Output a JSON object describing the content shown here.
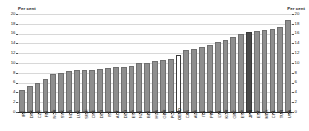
{
  "axes": {
    "left_title": "Per cent",
    "right_title": "Per cent",
    "ticks": [
      "0",
      "2",
      "4",
      "6",
      "8",
      "10",
      "12",
      "14",
      "16",
      "18",
      "20"
    ]
  },
  "chart_data": {
    "type": "bar",
    "title": "Per cent",
    "xlabel": "",
    "ylabel": "Per cent",
    "ylim": [
      0,
      20
    ],
    "grid": true,
    "legend": "none",
    "sorted": "ascending",
    "categories": [
      "IRL",
      "DNK",
      "CZE",
      "FIN",
      "NOR",
      "SVK",
      "NLD",
      "LUX",
      "SWE",
      "CHE",
      "DEU",
      "ISL",
      "AUT",
      "DEU",
      "ESP",
      "NZL",
      "BEL",
      "HUN",
      "GBR",
      "POL",
      "OECD",
      "CAN",
      "AUS",
      "ITA",
      "PRT",
      "LVA",
      "KOR",
      "GRC",
      "ESP",
      "JPN",
      "EST",
      "MEX",
      "CHL",
      "TUR",
      "USA"
    ],
    "values": [
      4.5,
      5.3,
      6.0,
      6.8,
      7.8,
      8.0,
      8.4,
      8.5,
      8.5,
      8.6,
      8.8,
      9.0,
      9.1,
      9.2,
      9.3,
      10.0,
      10.1,
      10.4,
      10.6,
      10.8,
      11.7,
      12.7,
      12.8,
      13.3,
      13.7,
      14.2,
      14.6,
      15.3,
      16.0,
      16.3,
      16.5,
      16.8,
      17.0,
      17.4,
      18.7
    ],
    "highlight_open_index": 20,
    "highlight_dark_index": 29,
    "colors": {
      "bar": "#8e8e8e",
      "bar_border": "#6f6f6f",
      "highlight_open": "#ffffff",
      "highlight_dark": "#4a4a4a",
      "grid": "#d8d8d8",
      "axis": "#2b2b2b",
      "text": "#1a1a1a"
    }
  }
}
